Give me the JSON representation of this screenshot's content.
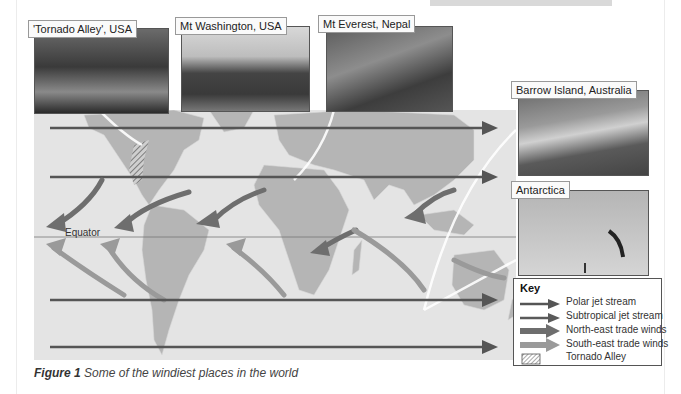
{
  "figure": {
    "number_label": "Figure 1",
    "caption": "Some of the windiest places in the world"
  },
  "map": {
    "equator_label": "Equator",
    "colors": {
      "background": "#e4e4e4",
      "land": "#b5b5b5",
      "polar_jet": "#555555",
      "subtropical_jet": "#5a5a5a",
      "ne_trade": "#6e6e6e",
      "se_trade": "#9a9a9a"
    }
  },
  "photos": [
    {
      "label": "'Tornado Alley', USA"
    },
    {
      "label": "Mt Washington, USA"
    },
    {
      "label": "Mt Everest, Nepal"
    },
    {
      "label": "Barrow Island, Australia"
    },
    {
      "label": "Antarctica"
    }
  ],
  "key": {
    "title": "Key",
    "items": [
      {
        "label": "Polar jet stream",
        "icon": "thin-arrow-icon"
      },
      {
        "label": "Subtropical jet stream",
        "icon": "thin-arrow-icon"
      },
      {
        "label": "North-east trade winds",
        "icon": "thick-arrow-icon"
      },
      {
        "label": "South-east trade winds",
        "icon": "thick-arrow-icon"
      },
      {
        "label": "Tornado Alley",
        "icon": "hatched-box-icon"
      }
    ]
  }
}
